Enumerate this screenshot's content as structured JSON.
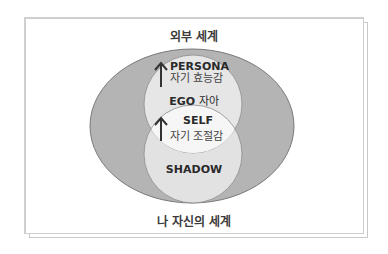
{
  "diagram": {
    "outer_label": "외부 세계",
    "inner_label": "나 자신의 세계",
    "persona": {
      "title": "PERSONA",
      "subtitle": "자기 효능감",
      "arrow": "up-arrow-icon"
    },
    "ego": {
      "title": "EGO",
      "subtitle": "자아"
    },
    "self": {
      "title": "SELF",
      "subtitle": "자기 조절감",
      "arrow": "up-arrow-icon"
    },
    "shadow": {
      "title": "SHADOW"
    }
  },
  "colors": {
    "ellipse_fill": "#b4b4b4",
    "ellipse_stroke": "#7a7a7a",
    "ego_circle_fill": "#e6e6e6",
    "shadow_circle_fill": "#e2e2e2",
    "overlap_fill": "#f6f6f6",
    "text": "#2a2a2a"
  }
}
